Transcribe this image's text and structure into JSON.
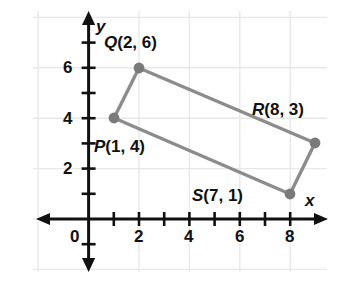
{
  "figure": {
    "type": "coordinate-plane-quadrilateral",
    "background_color": "#ffffff",
    "grid_color": "#e8e8e8",
    "axis_color": "#111111",
    "shape_stroke_color": "#8c8c8c",
    "vertex_color": "#7a7a7a"
  },
  "axes": {
    "x_axis_label": "x",
    "y_axis_label": "y",
    "origin_label": "0",
    "x_tick_labels": [
      "2",
      "4",
      "6",
      "8"
    ],
    "y_tick_labels": [
      "2",
      "4",
      "6"
    ],
    "x_ticks_all": [
      1,
      2,
      3,
      4,
      5,
      6,
      7,
      8
    ],
    "y_ticks_all": [
      1,
      2,
      3,
      4,
      5,
      6,
      7
    ],
    "x_range": [
      -0.5,
      8.8
    ],
    "y_range": [
      -2.0,
      7.3
    ]
  },
  "chart_data": {
    "type": "scatter",
    "title": "",
    "xlabel": "x",
    "ylabel": "y",
    "xlim": [
      -0.5,
      8.8
    ],
    "ylim": [
      -2.0,
      7.3
    ],
    "grid": true,
    "legend": "none",
    "points": [
      {
        "name": "P",
        "x": 1,
        "y": 4,
        "label": "P(1, 4)"
      },
      {
        "name": "Q",
        "x": 2,
        "y": 6,
        "label": "Q(2, 6)"
      },
      {
        "name": "R",
        "x": 8,
        "y": 3,
        "label": "R(8, 3)"
      },
      {
        "name": "S",
        "x": 7,
        "y": 1,
        "label": "S(7, 1)"
      }
    ],
    "polygon_order": [
      "P",
      "Q",
      "R",
      "S"
    ],
    "annotations": [
      {
        "text": "Q(2, 6)",
        "x": 2,
        "y": 6,
        "placement": "above-left"
      },
      {
        "text": "R(8, 3)",
        "x": 8,
        "y": 3,
        "placement": "above-left"
      },
      {
        "text": "P(1, 4)",
        "x": 1,
        "y": 4,
        "placement": "below-right"
      },
      {
        "text": "S(7, 1)",
        "x": 7,
        "y": 1,
        "placement": "left"
      }
    ]
  },
  "labels": {
    "p": "P(1, 4)",
    "q": "Q(2, 6)",
    "r": "R(8, 3)",
    "s": "S(7, 1)",
    "x_axis": "x",
    "y_axis": "y",
    "zero": "0",
    "x2": "2",
    "x4": "4",
    "x6": "6",
    "x8": "8",
    "y2": "2",
    "y4": "4",
    "y6": "6"
  }
}
